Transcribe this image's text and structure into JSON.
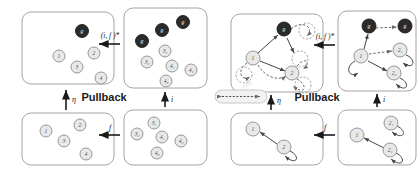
{
  "figure": {
    "title_text": "Pullback",
    "background": "#ffffff",
    "node_light_fill": "#e8e8e8",
    "node_light_stroke": "#8c8c8c",
    "node_dark_fill": "#2b2b2b",
    "node_dark_stroke": "#1a1a1a",
    "box_stroke": "#9a9a9a",
    "arrow_color": "#1a1a1a",
    "edge_color": "#555555",
    "dashed_color": "#6b6b6b",
    "label_text_light": "#4a4a4a",
    "label_text_dark": "#ffffff"
  },
  "diagrams": [
    {
      "id": "left",
      "name": "sets-pullback-diagram",
      "center_label": "Pullback",
      "arrows": [
        {
          "name": "arrow-top-horizontal",
          "label": "(i, f )*",
          "direction": "left"
        },
        {
          "name": "arrow-bottom-horizontal",
          "label": "f",
          "direction": "left"
        },
        {
          "name": "arrow-left-vertical",
          "label": "η",
          "direction": "up"
        },
        {
          "name": "arrow-right-vertical",
          "label": "i",
          "direction": "up"
        }
      ],
      "boxes": [
        {
          "name": "box-top-left",
          "nodes": [
            {
              "id": "tl-g",
              "label": "g",
              "style": "dark",
              "cx": 60,
              "cy": 19,
              "r": 6.5
            },
            {
              "id": "tl-1",
              "label": "1",
              "style": "light",
              "cx": 37,
              "cy": 44,
              "r": 6
            },
            {
              "id": "tl-2",
              "label": "2",
              "style": "light",
              "cx": 72,
              "cy": 41,
              "r": 6
            },
            {
              "id": "tl-3",
              "label": "3",
              "style": "light",
              "cx": 55,
              "cy": 55,
              "r": 6
            },
            {
              "id": "tl-4",
              "label": "4",
              "style": "light",
              "cx": 79,
              "cy": 66,
              "r": 6
            }
          ]
        },
        {
          "name": "box-top-right",
          "nodes": [
            {
              "id": "tr-g1",
              "label": "g",
              "style": "dark",
              "cx": 18,
              "cy": 33,
              "r": 6.5
            },
            {
              "id": "tr-g2",
              "label": "g",
              "style": "dark",
              "cx": 38,
              "cy": 22,
              "r": 6.5
            },
            {
              "id": "tr-g3",
              "label": "g",
              "style": "dark",
              "cx": 59,
              "cy": 14,
              "r": 6.5
            },
            {
              "id": "tr-31",
              "label": "3₁",
              "style": "light",
              "cx": 41,
              "cy": 43,
              "r": 6
            },
            {
              "id": "tr-32",
              "label": "3₂",
              "style": "light",
              "cx": 23,
              "cy": 54,
              "r": 6
            },
            {
              "id": "tr-41",
              "label": "4₁",
              "style": "light",
              "cx": 48,
              "cy": 58,
              "r": 6
            },
            {
              "id": "tr-42",
              "label": "4₂",
              "style": "light",
              "cx": 67,
              "cy": 62,
              "r": 6
            },
            {
              "id": "tr-43",
              "label": "4₃",
              "style": "light",
              "cx": 42,
              "cy": 73,
              "r": 6
            }
          ]
        },
        {
          "name": "box-bottom-left",
          "nodes": [
            {
              "id": "bl-1",
              "label": "1",
              "style": "light",
              "cx": 24,
              "cy": 18,
              "r": 6
            },
            {
              "id": "bl-2",
              "label": "2",
              "style": "light",
              "cx": 58,
              "cy": 12,
              "r": 6
            },
            {
              "id": "bl-3",
              "label": "3",
              "style": "light",
              "cx": 42,
              "cy": 28,
              "r": 6
            },
            {
              "id": "bl-4",
              "label": "4",
              "style": "light",
              "cx": 64,
              "cy": 41,
              "r": 6
            }
          ]
        },
        {
          "name": "box-bottom-right",
          "nodes": [
            {
              "id": "br-31",
              "label": "3₁",
              "style": "light",
              "cx": 30,
              "cy": 13,
              "r": 6
            },
            {
              "id": "br-32",
              "label": "3₂",
              "style": "light",
              "cx": 13,
              "cy": 24,
              "r": 6
            },
            {
              "id": "br-41",
              "label": "4₁",
              "style": "light",
              "cx": 38,
              "cy": 27,
              "r": 6
            },
            {
              "id": "br-42",
              "label": "4₂",
              "style": "light",
              "cx": 57,
              "cy": 31,
              "r": 6
            },
            {
              "id": "br-43",
              "label": "4₃",
              "style": "light",
              "cx": 33,
              "cy": 43,
              "r": 6
            }
          ]
        }
      ]
    },
    {
      "id": "right",
      "name": "graphs-pullback-diagram",
      "center_label": "Pullback",
      "callout": {
        "name": "edge-identification-callout",
        "label": ""
      },
      "arrows": [
        {
          "name": "arrow-top-horizontal",
          "label": "(i, f )*",
          "direction": "left"
        },
        {
          "name": "arrow-bottom-horizontal",
          "label": "f",
          "direction": "left"
        },
        {
          "name": "arrow-left-vertical",
          "label": "η",
          "direction": "up"
        },
        {
          "name": "arrow-right-vertical",
          "label": "i",
          "direction": "up"
        }
      ],
      "boxes": [
        {
          "name": "box-top-left",
          "nodes": [
            {
              "id": "rtl-g",
              "label": "g",
              "style": "dark",
              "cx": 53,
              "cy": 15,
              "r": 7
            },
            {
              "id": "rtl-1",
              "label": "1",
              "style": "light",
              "cx": 22,
              "cy": 44,
              "r": 7
            },
            {
              "id": "rtl-2",
              "label": "2",
              "style": "light",
              "cx": 61,
              "cy": 59,
              "r": 7
            },
            {
              "id": "rtl-p1",
              "label": "",
              "style": "phantom",
              "cx": 76,
              "cy": 17,
              "r": 8
            },
            {
              "id": "rtl-p2",
              "label": "",
              "style": "phantom",
              "cx": 13,
              "cy": 61,
              "r": 8
            },
            {
              "id": "rtl-p3",
              "label": "",
              "style": "phantom",
              "cx": 69,
              "cy": 45,
              "r": 8
            },
            {
              "id": "rtl-p4",
              "label": "",
              "style": "phantom",
              "cx": 72,
              "cy": 71,
              "r": 8
            }
          ]
        },
        {
          "name": "box-top-right",
          "nodes": [
            {
              "id": "rtr-g1",
              "label": "g",
              "style": "dark",
              "cx": 31,
              "cy": 15,
              "r": 7
            },
            {
              "id": "rtr-g2",
              "label": "g",
              "style": "dark",
              "cx": 67,
              "cy": 15,
              "r": 7
            },
            {
              "id": "rtr-1",
              "label": "1",
              "style": "light",
              "cx": 23,
              "cy": 45,
              "r": 7
            },
            {
              "id": "rtr-21",
              "label": "2₁",
              "style": "light",
              "cx": 62,
              "cy": 39,
              "r": 7
            },
            {
              "id": "rtr-22",
              "label": "2₂",
              "style": "light",
              "cx": 56,
              "cy": 62,
              "r": 7
            }
          ]
        },
        {
          "name": "box-bottom-left",
          "nodes": [
            {
              "id": "rbl-1",
              "label": "1",
              "style": "light",
              "cx": 22,
              "cy": 16,
              "r": 7
            },
            {
              "id": "rbl-2",
              "label": "2",
              "style": "light",
              "cx": 53,
              "cy": 34,
              "r": 7
            }
          ]
        },
        {
          "name": "box-bottom-right",
          "nodes": [
            {
              "id": "rbr-1",
              "label": "1",
              "style": "light",
              "cx": 19,
              "cy": 25,
              "r": 7
            },
            {
              "id": "rbr-21",
              "label": "2₁",
              "style": "light",
              "cx": 53,
              "cy": 13,
              "r": 7
            },
            {
              "id": "rbr-22",
              "label": "2₂",
              "style": "light",
              "cx": 52,
              "cy": 40,
              "r": 7
            }
          ]
        }
      ]
    }
  ]
}
